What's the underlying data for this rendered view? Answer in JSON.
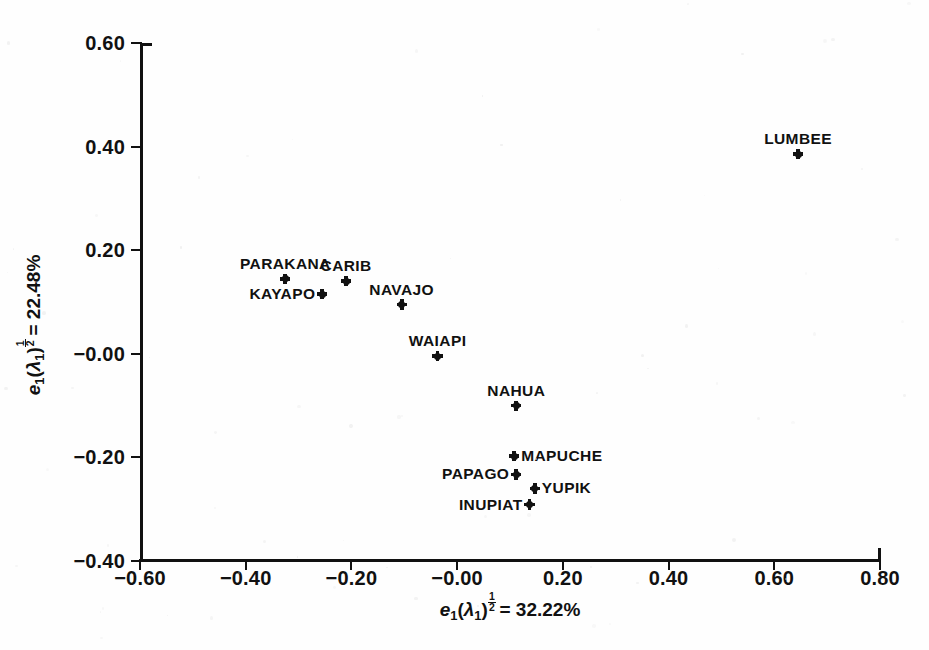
{
  "chart_data": {
    "type": "scatter",
    "title": "",
    "xlabel": "e1(λ1)^1/2 = 32.22%",
    "ylabel": "e1(λ1)^1/2 = 22.48%",
    "xlabel_parts": {
      "symbol": "e",
      "sub": "1",
      "lambda": "λ",
      "lambda_sub": "1",
      "exp_num": "1",
      "exp_den": "2",
      "equals": "=",
      "value": "32.22%"
    },
    "ylabel_parts": {
      "symbol": "e",
      "sub": "1",
      "lambda": "λ",
      "lambda_sub": "1",
      "exp_num": "1",
      "exp_den": "2",
      "equals": "=",
      "value": "22.48%"
    },
    "xlim": [
      -0.6,
      0.8
    ],
    "ylim": [
      -0.4,
      0.6
    ],
    "xticks": [
      -0.6,
      -0.4,
      -0.2,
      -0.0,
      0.2,
      0.4,
      0.6,
      0.8
    ],
    "yticks": [
      0.6,
      0.4,
      0.2,
      -0.0,
      -0.2,
      -0.4
    ],
    "xticklabels": [
      "-0.60",
      "-0.40",
      "-0.20",
      "-0.00",
      "0.20",
      "0.40",
      "0.60",
      "0.80"
    ],
    "yticklabels": [
      "0.60",
      "0.40",
      "0.20",
      "-0.00",
      "-0.20",
      "-0.40"
    ],
    "grid": false,
    "legend": false,
    "marker_color": "#111111",
    "points": [
      {
        "label": "LUMBEE",
        "x": 0.645,
        "y": 0.385,
        "label_pos": "above"
      },
      {
        "label": "PARAKANA",
        "x": -0.325,
        "y": 0.145,
        "label_pos": "above"
      },
      {
        "label": "CARIB",
        "x": -0.21,
        "y": 0.14,
        "label_pos": "above"
      },
      {
        "label": "KAYAPO",
        "x": -0.255,
        "y": 0.115,
        "label_pos": "left"
      },
      {
        "label": "NAVAJO",
        "x": -0.105,
        "y": 0.095,
        "label_pos": "above"
      },
      {
        "label": "WAIAPI",
        "x": -0.037,
        "y": -0.005,
        "label_pos": "above"
      },
      {
        "label": "NAHUA",
        "x": 0.112,
        "y": -0.1,
        "label_pos": "above"
      },
      {
        "label": "MAPUCHE",
        "x": 0.108,
        "y": -0.198,
        "label_pos": "right"
      },
      {
        "label": "PAPAGO",
        "x": 0.112,
        "y": -0.233,
        "label_pos": "left"
      },
      {
        "label": "YUPIK",
        "x": 0.147,
        "y": -0.26,
        "label_pos": "right"
      },
      {
        "label": "INUPIAT",
        "x": 0.137,
        "y": -0.291,
        "label_pos": "left"
      }
    ]
  }
}
